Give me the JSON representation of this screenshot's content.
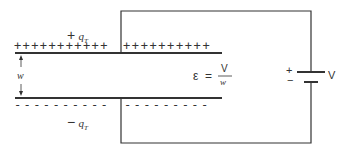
{
  "diagram": {
    "top_charge_label": {
      "sign": "+",
      "symbol": "q",
      "subscript": "T"
    },
    "bottom_charge_label": {
      "sign": "−",
      "symbol": "q",
      "subscript": "T"
    },
    "separation_label": "w",
    "field_equation": {
      "lhs": "ε",
      "equals": "=",
      "numerator": "V",
      "denominator": "w"
    },
    "battery": {
      "plus": "+",
      "minus": "−",
      "label": "V"
    },
    "top_plate_charges_left": "+++++++++++",
    "top_plate_charges_right": "++++++++++",
    "bottom_plate_charges_left": "----------",
    "bottom_plate_charges_right": "---------",
    "colors": {
      "line": "#333333",
      "background": "#ffffff"
    }
  }
}
